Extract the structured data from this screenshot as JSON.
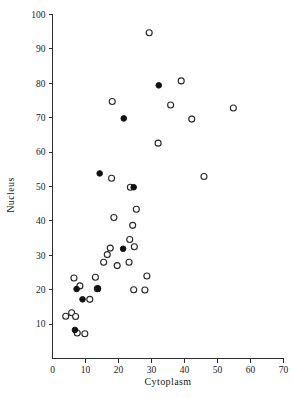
{
  "chart_data": {
    "type": "scatter",
    "title": "",
    "xlabel": "Cytoplasm",
    "ylabel": "Nucleus",
    "xlim": [
      0,
      70
    ],
    "ylim": [
      0,
      100
    ],
    "xticks": [
      0,
      10,
      20,
      30,
      40,
      50,
      60,
      70
    ],
    "yticks": [
      10,
      20,
      30,
      40,
      50,
      60,
      70,
      80,
      90,
      100
    ],
    "xtick_labels": [
      "0",
      "10",
      "20",
      "30",
      "40",
      "50",
      "60",
      "70"
    ],
    "ytick_labels": [
      "10",
      "20",
      "30",
      "40",
      "50",
      "60",
      "70",
      "80",
      "90",
      "100"
    ],
    "grid": false,
    "legend_position": "none",
    "series": [
      {
        "name": "open-circle",
        "marker": "open circle",
        "color": "#242424",
        "points": [
          [
            4.0,
            12.3
          ],
          [
            5.8,
            13.3
          ],
          [
            6.5,
            23.4
          ],
          [
            7.0,
            12.2
          ],
          [
            7.5,
            7.4
          ],
          [
            8.3,
            21.1
          ],
          [
            9.8,
            7.2
          ],
          [
            11.3,
            17.2
          ],
          [
            13.0,
            23.6
          ],
          [
            13.6,
            20.3
          ],
          [
            15.5,
            28.0
          ],
          [
            16.6,
            30.2
          ],
          [
            17.5,
            32.1
          ],
          [
            17.9,
            52.4
          ],
          [
            18.1,
            74.7
          ],
          [
            18.6,
            41.0
          ],
          [
            19.6,
            27.0
          ],
          [
            23.2,
            28.0
          ],
          [
            23.4,
            34.6
          ],
          [
            23.6,
            49.8
          ],
          [
            24.3,
            38.7
          ],
          [
            24.6,
            20.0
          ],
          [
            24.8,
            32.5
          ],
          [
            25.4,
            43.4
          ],
          [
            28.0,
            19.9
          ],
          [
            28.6,
            24.0
          ],
          [
            29.3,
            94.7
          ],
          [
            32.0,
            62.6
          ],
          [
            35.8,
            73.7
          ],
          [
            39.0,
            80.7
          ],
          [
            42.2,
            69.6
          ],
          [
            45.9,
            52.9
          ],
          [
            54.8,
            72.8
          ]
        ]
      },
      {
        "name": "filled-circle",
        "marker": "filled circle",
        "color": "#111111",
        "points": [
          [
            6.8,
            8.3
          ],
          [
            7.3,
            20.2
          ],
          [
            9.1,
            17.2
          ],
          [
            13.8,
            20.3
          ],
          [
            14.3,
            53.8
          ],
          [
            21.4,
            31.9
          ],
          [
            21.6,
            69.8
          ],
          [
            24.6,
            49.8
          ],
          [
            32.2,
            79.4
          ]
        ]
      }
    ]
  },
  "axes": {
    "x_label": "Cytoplasm",
    "y_label": "Nucleus"
  }
}
